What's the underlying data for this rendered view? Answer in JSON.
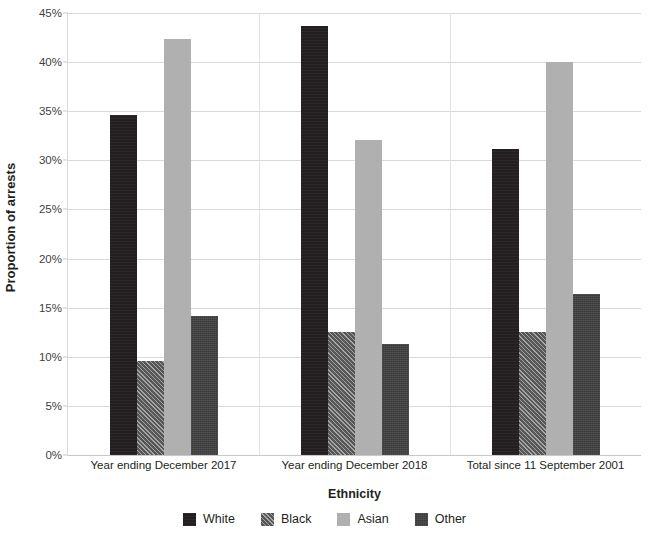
{
  "chart_data": {
    "type": "bar",
    "title": "",
    "xlabel": "Ethnicity",
    "ylabel": "Proportion of arrests",
    "ylim": [
      0,
      45
    ],
    "ytick_labels": [
      "0%",
      "5%",
      "10%",
      "15%",
      "20%",
      "25%",
      "30%",
      "35%",
      "40%",
      "45%"
    ],
    "ytick_values": [
      0,
      5,
      10,
      15,
      20,
      25,
      30,
      35,
      40,
      45
    ],
    "grid": true,
    "legend_position": "bottom",
    "value_suffix": "%",
    "categories": [
      "Year ending December 2017",
      "Year ending December 2018",
      "Total since 11 September 2001"
    ],
    "series": [
      {
        "name": "White",
        "values": [
          34.6,
          43.7,
          31.2
        ],
        "color": "#231f20",
        "pattern": "solid-dark"
      },
      {
        "name": "Black",
        "values": [
          9.6,
          12.5,
          12.5
        ],
        "color": "#6e6e6e",
        "pattern": "diagonal-hatch"
      },
      {
        "name": "Asian",
        "values": [
          42.4,
          32.1,
          40.0
        ],
        "color": "#b0b0b0",
        "pattern": "solid-light"
      },
      {
        "name": "Other",
        "values": [
          14.2,
          11.3,
          16.4
        ],
        "color": "#3a3a3a",
        "pattern": "dark-texture"
      }
    ]
  },
  "legend": {
    "items": [
      {
        "label": "White"
      },
      {
        "label": "Black"
      },
      {
        "label": "Asian"
      },
      {
        "label": "Other"
      }
    ]
  }
}
